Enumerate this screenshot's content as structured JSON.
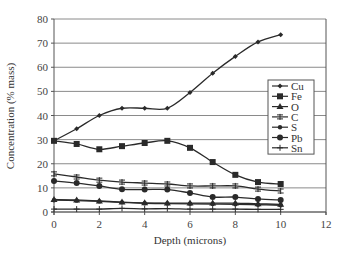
{
  "chart_data": {
    "type": "line",
    "title": "",
    "xlabel": "Depth (microns)",
    "ylabel": "Concentration (% mass)",
    "xlim": [
      0,
      12
    ],
    "ylim": [
      0,
      80
    ],
    "xticks": [
      0,
      2,
      4,
      6,
      8,
      10,
      12
    ],
    "yticks": [
      0,
      10,
      20,
      30,
      40,
      50,
      60,
      70,
      80
    ],
    "grid": "horizontal",
    "legend_position": "right-inside",
    "x": [
      0,
      1,
      2,
      3,
      4,
      5,
      6,
      7,
      8,
      9,
      10
    ],
    "series": [
      {
        "name": "Cu",
        "marker": "diamond",
        "values": [
          29.5,
          34.5,
          40,
          43,
          43,
          43,
          49.5,
          57.5,
          64.5,
          70.5,
          73.5
        ]
      },
      {
        "name": "Fe",
        "marker": "square",
        "values": [
          29.5,
          28.2,
          26,
          27.3,
          28.6,
          29.5,
          26.6,
          20.7,
          15.4,
          12.4,
          11.6
        ]
      },
      {
        "name": "O",
        "marker": "triangle",
        "values": [
          5.2,
          5,
          4.6,
          4.1,
          3.8,
          3.7,
          3.7,
          3.7,
          3.7,
          3.4,
          3.2
        ]
      },
      {
        "name": "C",
        "marker": "cross",
        "values": [
          15.8,
          14.5,
          13.2,
          12.4,
          12,
          11.6,
          10.8,
          10.8,
          10.8,
          9.5,
          8.7
        ]
      },
      {
        "name": "S",
        "marker": "star",
        "values": [
          4.9,
          4.7,
          4.4,
          4,
          3.6,
          3.5,
          3.4,
          3.3,
          3.2,
          3,
          2.8
        ]
      },
      {
        "name": "Pb",
        "marker": "circle",
        "values": [
          12.9,
          12,
          10.8,
          9.4,
          9.3,
          9.3,
          7.9,
          6.2,
          6.2,
          5.4,
          5
        ]
      },
      {
        "name": "Sn",
        "marker": "plus",
        "values": [
          1.2,
          1.2,
          1.2,
          1.5,
          1.3,
          1.4,
          1.2,
          1.2,
          1.2,
          1.1,
          1.1
        ]
      }
    ]
  },
  "colors": {
    "line": "#2a2a2a",
    "grid": "#8a8a8a",
    "axis": "#555555",
    "background": "#ffffff"
  }
}
